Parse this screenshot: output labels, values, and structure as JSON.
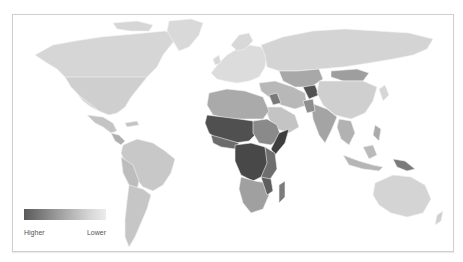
{
  "map": {
    "type": "choropleth",
    "projection": "world",
    "colors": {
      "higher": "#4a4a4a",
      "high": "#6e6e6e",
      "mid": "#9a9a9a",
      "low": "#bdbdbd",
      "lower": "#d6d6d6",
      "border": "#f2f2f2",
      "frame_border": "#cfcfcf"
    },
    "regions": [
      {
        "name": "North America",
        "level": "lower"
      },
      {
        "name": "Greenland",
        "level": "lower"
      },
      {
        "name": "Central America",
        "level": "low"
      },
      {
        "name": "South America",
        "level": "low"
      },
      {
        "name": "Europe",
        "level": "lower"
      },
      {
        "name": "Russia",
        "level": "lower"
      },
      {
        "name": "Central Asia",
        "level": "mid"
      },
      {
        "name": "Afghanistan",
        "level": "higher"
      },
      {
        "name": "Middle East",
        "level": "low"
      },
      {
        "name": "Iraq",
        "level": "high"
      },
      {
        "name": "North Africa",
        "level": "mid"
      },
      {
        "name": "West Africa",
        "level": "higher"
      },
      {
        "name": "Central Africa",
        "level": "higher"
      },
      {
        "name": "East Africa",
        "level": "high"
      },
      {
        "name": "Somalia",
        "level": "higher"
      },
      {
        "name": "Southern Africa",
        "level": "mid"
      },
      {
        "name": "Madagascar",
        "level": "high"
      },
      {
        "name": "South Asia",
        "level": "mid"
      },
      {
        "name": "China",
        "level": "lower"
      },
      {
        "name": "Mongolia",
        "level": "mid"
      },
      {
        "name": "Southeast Asia",
        "level": "mid"
      },
      {
        "name": "Papua New Guinea",
        "level": "high"
      },
      {
        "name": "Australia",
        "level": "lower"
      }
    ]
  },
  "legend": {
    "higher_label": "Higher",
    "lower_label": "Lower",
    "gradient_from": "#5a5a5a",
    "gradient_to": "#ececec"
  }
}
